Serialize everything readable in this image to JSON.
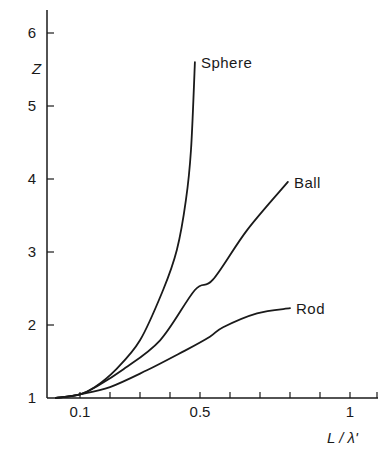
{
  "chart_data": {
    "type": "line",
    "title": "",
    "xlabel": "L / λ'",
    "ylabel": "Z",
    "xlim": [
      0,
      1.09
    ],
    "ylim": [
      1,
      6.3
    ],
    "grid": false,
    "legend": "inline labels at curve ends",
    "x_ticks": [
      0.1,
      0.2,
      0.3,
      0.4,
      0.5,
      0.6,
      0.7,
      0.8,
      0.9,
      1.0,
      1.09
    ],
    "x_tick_labels": [
      {
        "value": 0.1,
        "label": "0.1"
      },
      {
        "value": 0.5,
        "label": "0.5"
      },
      {
        "value": 1.0,
        "label": "1"
      }
    ],
    "y_ticks": [
      1,
      2,
      3,
      4,
      5,
      6
    ],
    "y_tick_labels": [
      "1",
      "2",
      "3",
      "4",
      "5",
      "6"
    ],
    "series": [
      {
        "name": "Sphere",
        "points": [
          [
            0.02,
            1.0
          ],
          [
            0.1,
            1.05
          ],
          [
            0.15,
            1.15
          ],
          [
            0.217,
            1.38
          ],
          [
            0.3,
            1.79
          ],
          [
            0.377,
            2.48
          ],
          [
            0.423,
            3.03
          ],
          [
            0.453,
            3.71
          ],
          [
            0.47,
            4.4
          ],
          [
            0.483,
            5.6
          ]
        ]
      },
      {
        "name": "Ball",
        "points": [
          [
            0.02,
            1.0
          ],
          [
            0.1,
            1.05
          ],
          [
            0.16,
            1.17
          ],
          [
            0.24,
            1.38
          ],
          [
            0.367,
            1.79
          ],
          [
            0.483,
            2.48
          ],
          [
            0.543,
            2.62
          ],
          [
            0.657,
            3.3
          ],
          [
            0.793,
            3.96
          ]
        ]
      },
      {
        "name": "Rod",
        "points": [
          [
            0.02,
            1.0
          ],
          [
            0.1,
            1.05
          ],
          [
            0.2,
            1.15
          ],
          [
            0.323,
            1.38
          ],
          [
            0.45,
            1.65
          ],
          [
            0.533,
            1.84
          ],
          [
            0.577,
            1.97
          ],
          [
            0.69,
            2.16
          ],
          [
            0.8,
            2.23
          ]
        ]
      }
    ]
  }
}
